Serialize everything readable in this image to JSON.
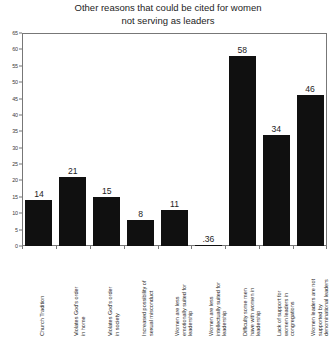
{
  "chart_data": {
    "type": "bar",
    "title": "Other reasons that could be cited for women\nnot serving as leaders",
    "xlabel": "",
    "ylabel": "",
    "ylim": [
      0,
      65
    ],
    "ytick_step": 5,
    "grid": false,
    "legend": "none",
    "categories": [
      "Church Tradition",
      "Violates God's order\nin home",
      "Violates God's order\nin society",
      "Increased possibility of\nsexual misconduct",
      "Women are less\nemotionally suited for\nleadership",
      "Women are less\nintellectually suited for\nleadership",
      "Difficulty some men\nhave with women in\nleadership",
      "Lack of support for\nwomen leaders in\ncongregations",
      "Women leaders are not\nsupported by\ndenominational leaders"
    ],
    "values": [
      14,
      21,
      15,
      8,
      11,
      0.36,
      58,
      34,
      46
    ],
    "value_labels": [
      "14",
      "21",
      "15",
      "8",
      "11",
      ".36",
      "58",
      "34",
      "46"
    ],
    "ytick_labels": [
      "0",
      "5",
      "10",
      "15",
      "20",
      "25",
      "30",
      "35",
      "40",
      "45",
      "50",
      "55",
      "60",
      "65"
    ],
    "bar_color": "#101010",
    "axis_color": "#777777"
  }
}
